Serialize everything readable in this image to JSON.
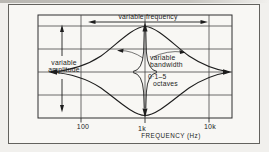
{
  "colors": {
    "paper": "#f8f7f4",
    "ink": "#1d1d1d",
    "frame_border": "#63625e",
    "grid_line": "#3c3c3c"
  },
  "labels": {
    "variable_frequency": "variable frequency",
    "variable_amplitude": [
      "variable",
      "amplitude"
    ],
    "variable_bandwidth": [
      "variable",
      "bandwidth"
    ],
    "octave_range": [
      "0·1–5",
      "octaves"
    ]
  },
  "axis": {
    "tick_labels": [
      "100",
      "1k",
      "10k"
    ],
    "axis_label": "FREQUENCY (Hz)"
  },
  "diagram": {
    "curve_names": [
      "wide-bandwidth boost bell",
      "wide-bandwidth cut bell",
      "narrow-bandwidth spike"
    ]
  }
}
